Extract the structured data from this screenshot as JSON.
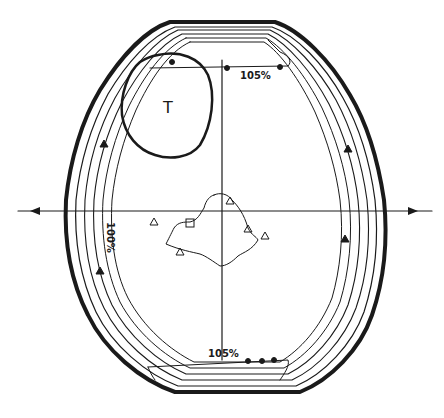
{
  "diagram": {
    "type": "isodose-distribution",
    "colors": {
      "ink": "#1a1a1a",
      "background": "#ffffff"
    },
    "labels": {
      "tumor": "T",
      "isodose_top": "105%",
      "isodose_bottom": "105%",
      "isodose_left": "100%"
    },
    "axes": {
      "horizontal": {
        "y": 211,
        "x_start": 18,
        "x_end": 432,
        "arrows": [
          "left-in",
          "right-in"
        ]
      },
      "vertical": {
        "x": 222,
        "y_start": 60,
        "y_end": 360
      }
    },
    "markers": [
      "triangle",
      "diamond",
      "cross",
      "square",
      "circle"
    ]
  }
}
